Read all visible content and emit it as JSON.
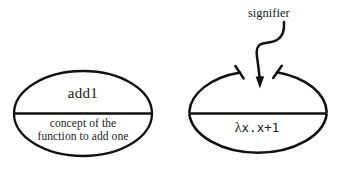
{
  "diagram": {
    "ink_color": "#111111",
    "background_color": "#ffffff",
    "stroke_width": 2.2,
    "annotation": {
      "label": "signifier",
      "arrow": "s-curve-down-arrow"
    },
    "ellipses": [
      {
        "id": "concept-ellipse",
        "name": "add1-concept-ellipse",
        "top_text": "add1",
        "bottom_text_lines": [
          "concept of the",
          "function to add one"
        ],
        "top_arc_open": false,
        "divider": true
      },
      {
        "id": "signifier-ellipse",
        "name": "lambda-signifier-ellipse",
        "top_text": "",
        "bottom_text_lines": [
          "λx.x+1"
        ],
        "bottom_text_prefix": "λ",
        "bottom_text_mono": "x.x+1",
        "top_arc_open": true,
        "divider": true
      }
    ]
  }
}
